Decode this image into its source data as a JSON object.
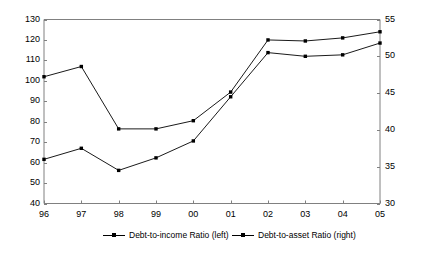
{
  "chart_data": {
    "type": "line",
    "title": "",
    "subtitle": "",
    "xlabel": "",
    "ylabel": "",
    "grid": false,
    "legend_position": "bottom",
    "categories": [
      "96",
      "97",
      "98",
      "99",
      "00",
      "01",
      "02",
      "03",
      "04",
      "05"
    ],
    "axes": {
      "left": {
        "label": "",
        "min": 40,
        "max": 130,
        "step": 10,
        "ticks": [
          40,
          50,
          60,
          70,
          80,
          90,
          100,
          110,
          120,
          130
        ]
      },
      "right": {
        "label": "",
        "min": 30,
        "max": 55,
        "step": 5,
        "ticks": [
          30,
          35,
          40,
          45,
          50,
          55
        ]
      },
      "x": {
        "label": "",
        "ticks": [
          "96",
          "97",
          "98",
          "99",
          "00",
          "01",
          "02",
          "03",
          "04",
          "05"
        ]
      }
    },
    "series": [
      {
        "name": "Debt-to-income Ratio (left)",
        "axis": "left",
        "color": "#000000",
        "marker": "square",
        "values": [
          102.0,
          107.0,
          76.5,
          76.5,
          80.5,
          94.5,
          120.0,
          119.5,
          121.0,
          124.0
        ]
      },
      {
        "name": "Debt-to-asset Ratio (right)",
        "axis": "right",
        "color": "#000000",
        "marker": "square",
        "values": [
          36.0,
          37.5,
          34.5,
          36.2,
          38.5,
          44.5,
          50.5,
          50.0,
          50.2,
          51.8
        ]
      }
    ]
  },
  "legend": {
    "items": [
      {
        "label": "Debt-to-income Ratio (left)"
      },
      {
        "label": "Debt-to-asset Ratio (right)"
      }
    ]
  }
}
